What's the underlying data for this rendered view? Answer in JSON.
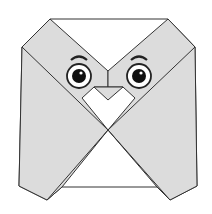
{
  "illustration": {
    "subject": "origami owl",
    "colors": {
      "paper_gray": "#dcdcdc",
      "paper_white": "#ffffff",
      "outline": "#333333",
      "pupil": "#111111"
    }
  }
}
